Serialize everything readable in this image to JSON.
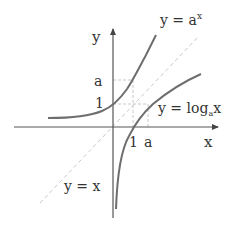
{
  "diagram": {
    "type": "function-graph",
    "axes": {
      "x_label": "x",
      "y_label": "y"
    },
    "ticks": {
      "x_one": "1",
      "x_a": "a",
      "y_one": "1",
      "y_a": "a"
    },
    "curves": [
      {
        "name": "exponential",
        "label_base": "y = a",
        "label_sup": "x"
      },
      {
        "name": "logarithm",
        "label_base": "y = log",
        "label_sub": "a",
        "label_tail": "x"
      },
      {
        "name": "identity",
        "label": "y = x"
      }
    ],
    "colors": {
      "axis": "#555555",
      "curve": "#6e6e6e",
      "identity_line": "#c8c8c8",
      "guide_lines": "#c8c8c8",
      "text": "#333333"
    }
  }
}
